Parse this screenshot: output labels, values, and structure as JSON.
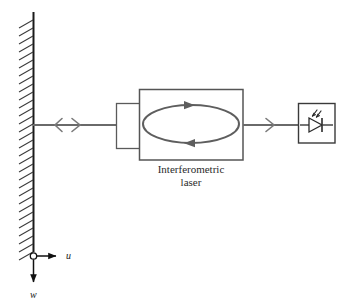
{
  "figure": {
    "width": 346,
    "height": 302,
    "background": "#ffffff",
    "type": "schematic-diagram"
  },
  "colors": {
    "beam": "#6a6a6a",
    "box_outline": "#555555",
    "ellipse": "#5e5e5e",
    "wall": "#1a1a1a",
    "hatch": "#333333",
    "text": "#2b2b2b",
    "axis": "#111111"
  },
  "labels": {
    "laser_line1": "Interferometric",
    "laser_line2": "laser",
    "axis_u": "u",
    "axis_w": "w"
  },
  "elements": {
    "wall": {
      "name": "fixed-wall",
      "x": 33,
      "y_top": 12,
      "y_bottom": 252,
      "hatch_count": 30
    },
    "beam_left": {
      "name": "beam-left-segment",
      "x1": 33,
      "x2": 116,
      "y": 125
    },
    "arrow_left": {
      "name": "displacement-arrow-left",
      "x": 60,
      "y": 125,
      "direction": "left"
    },
    "arrow_right": {
      "name": "displacement-arrow-right",
      "x": 78,
      "y": 125,
      "direction": "right"
    },
    "coupler_box": {
      "name": "coupler-box",
      "x": 116,
      "y": 103,
      "w": 24,
      "h": 45
    },
    "laser_box": {
      "name": "interferometric-laser-box",
      "x": 139,
      "y": 89,
      "w": 104,
      "h": 71
    },
    "cavity_ellipse": {
      "name": "laser-cavity-ellipse",
      "cx": 191,
      "cy": 124,
      "rx": 48,
      "ry": 19
    },
    "cavity_arrow_top": {
      "name": "cavity-arrow-top",
      "x": 191,
      "y": 105,
      "direction": "right"
    },
    "cavity_arrow_bottom": {
      "name": "cavity-arrow-bottom",
      "x": 188,
      "y": 143,
      "direction": "left"
    },
    "beam_right": {
      "name": "beam-right-segment",
      "x1": 243,
      "x2": 298,
      "y": 125
    },
    "arrow_out": {
      "name": "output-beam-arrow",
      "x": 272,
      "y": 125,
      "direction": "right"
    },
    "detector_box": {
      "name": "photodiode-detector-box",
      "x": 298,
      "y": 103,
      "w": 37,
      "h": 40
    },
    "photodiode": {
      "name": "photodiode-symbol",
      "cx": 316,
      "cy": 124
    },
    "origin": {
      "name": "coordinate-origin",
      "cx": 33,
      "cy": 256,
      "r": 3
    },
    "axis_u_arrow": {
      "name": "axis-u-arrow",
      "x1": 36,
      "x2": 62,
      "y": 256
    },
    "axis_w_arrow": {
      "name": "axis-w-arrow",
      "x": 33,
      "y1": 260,
      "y2": 288
    }
  }
}
